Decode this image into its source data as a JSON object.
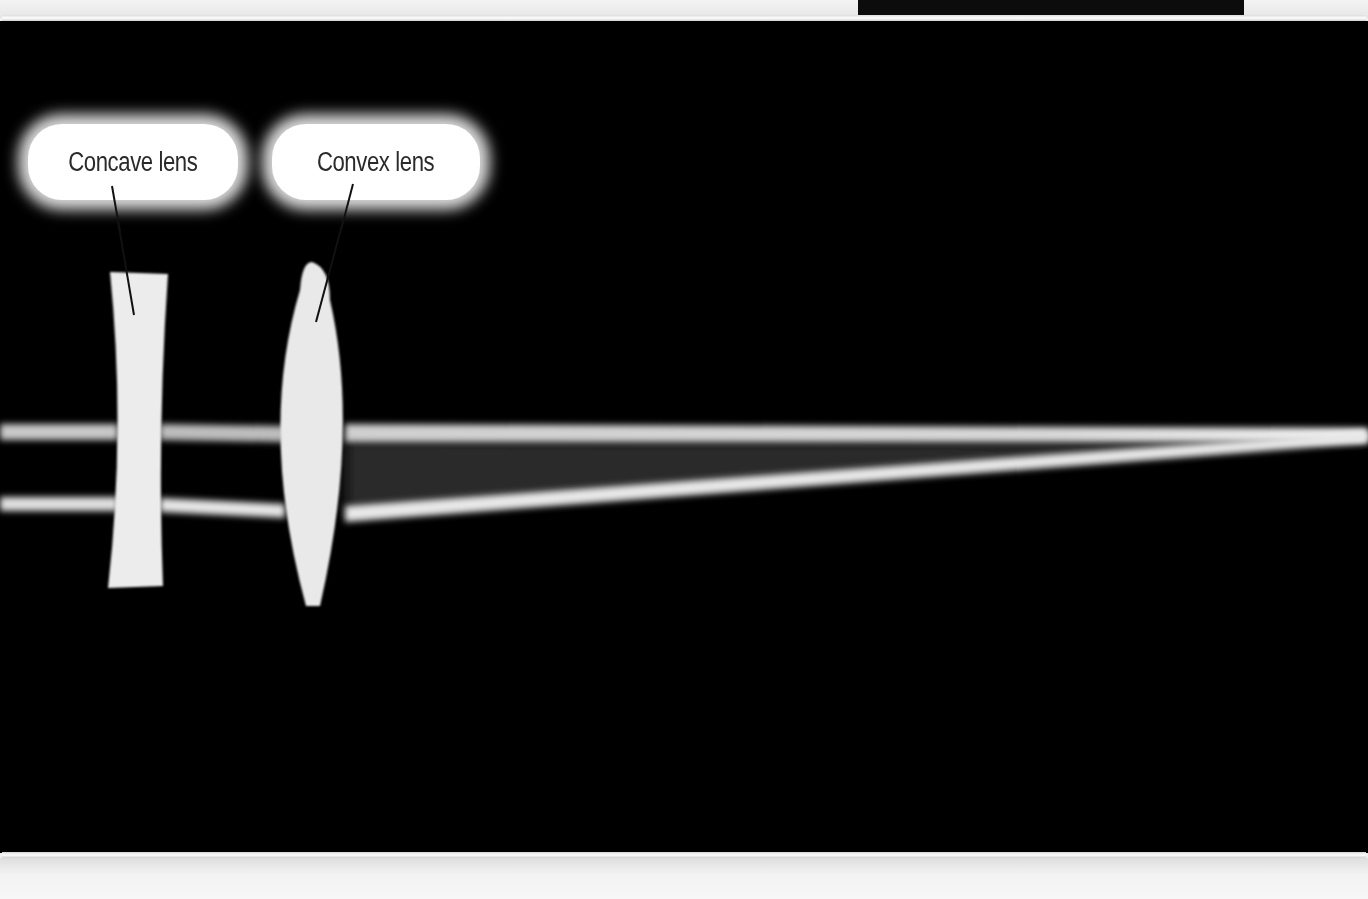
{
  "figure": {
    "background_color": "#000000",
    "ray_color": "#e8e8e8",
    "labels": [
      {
        "id": "concave",
        "text": "Concave lens"
      },
      {
        "id": "convex",
        "text": "Convex lens"
      }
    ]
  }
}
